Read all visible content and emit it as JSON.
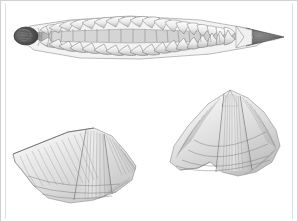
{
  "plate": {
    "title": "Fossil plate illustration",
    "medium": "engraving",
    "background_color": "#ffffff",
    "ink_color": "#5a5a5a",
    "border_color": "#cfd2d4",
    "caption": "",
    "figure_count": 3
  },
  "figures": [
    {
      "id": "fig-trilobite",
      "label": "",
      "name": "segmented-trilobite-fossil",
      "description": "Elongate segmented arthropod fossil in dorsal view, tapering to a point at the right",
      "orientation": "horizontal",
      "position": {
        "x": 14,
        "y": 13,
        "width": 268,
        "height": 50
      },
      "segment_count": 26,
      "axis_color": "#6a6a6a"
    },
    {
      "id": "fig-brachiopod-left",
      "label": "",
      "name": "winged-brachiopod-shell-left",
      "description": "Spiriferid brachiopod valve with broad lateral wings and radiating ribs, hinge line upper left",
      "orientation": "oblique",
      "position": {
        "x": 12,
        "y": 112,
        "width": 124,
        "height": 92
      },
      "rib_count": 34
    },
    {
      "id": "fig-brachiopod-right",
      "label": "",
      "name": "winged-brachiopod-shell-right",
      "description": "Spiriferid brachiopod valve with prominent median fold and strong radiating ribs, beak at top",
      "orientation": "oblique",
      "position": {
        "x": 168,
        "y": 88,
        "width": 110,
        "height": 92
      },
      "rib_count": 30
    }
  ]
}
